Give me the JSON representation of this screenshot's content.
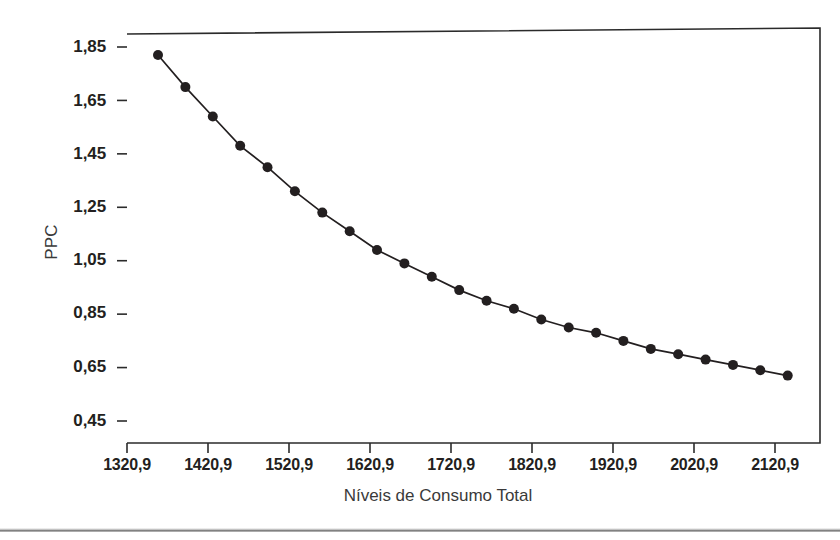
{
  "chart_data": {
    "type": "line",
    "title": "",
    "subtitle": "",
    "xlabel": "Níveis de Consumo Total",
    "ylabel": "PPC",
    "xlim": [
      1320.9,
      2160.9
    ],
    "ylim": [
      0.45,
      1.89
    ],
    "grid": false,
    "legend": null,
    "marker": "filled-circle",
    "line_color": "#231f20",
    "marker_color": "#231f20",
    "xticks": [
      "1320,9",
      "1420,9",
      "1520,9",
      "1620,9",
      "1720,9",
      "1820,9",
      "1920,9",
      "2020,9",
      "2120,9"
    ],
    "xtick_values": [
      1320.9,
      1420.9,
      1520.9,
      1620.9,
      1720.9,
      1820.9,
      1920.9,
      2020.9,
      2120.9
    ],
    "yticks": [
      "1,85",
      "1,65",
      "1,45",
      "1,25",
      "1,05",
      "0,85",
      "0,65",
      "0,45"
    ],
    "ytick_values": [
      1.85,
      1.65,
      1.45,
      1.25,
      1.05,
      0.85,
      0.65,
      0.45
    ],
    "x": [
      1359.2,
      1393.0,
      1426.8,
      1460.6,
      1494.4,
      1528.2,
      1562.0,
      1595.8,
      1629.6,
      1663.4,
      1697.2,
      1731.0,
      1764.8,
      1798.6,
      1832.4,
      1866.2,
      1900.0,
      1933.8,
      1967.6,
      2001.4,
      2035.2,
      2069.0,
      2102.8,
      2136.6
    ],
    "values": [
      1.82,
      1.7,
      1.59,
      1.48,
      1.4,
      1.31,
      1.23,
      1.16,
      1.09,
      1.04,
      0.99,
      0.94,
      0.9,
      0.87,
      0.83,
      0.8,
      0.78,
      0.75,
      0.72,
      0.7,
      0.68,
      0.66,
      0.64,
      0.62
    ]
  },
  "axes": {
    "y_title": "PPC",
    "x_title": "Níveis de Consumo Total"
  }
}
